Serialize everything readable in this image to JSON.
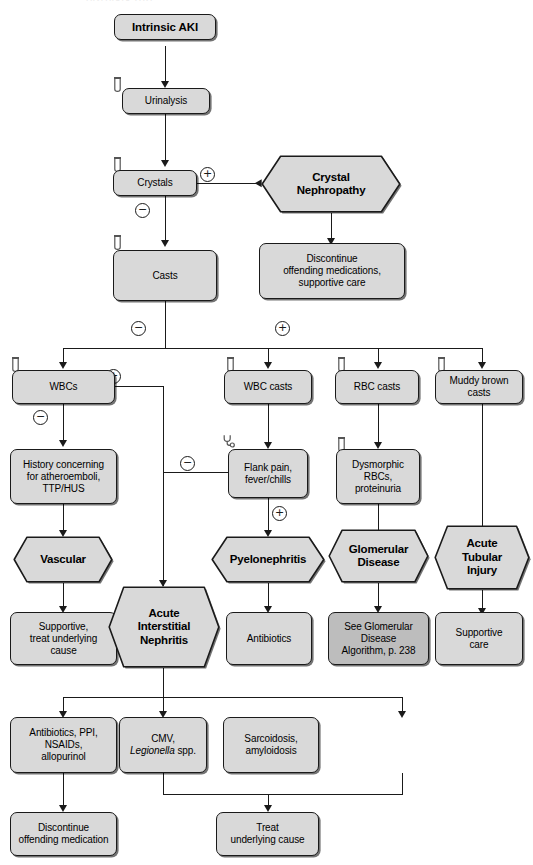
{
  "diagram": {
    "colors": {
      "node_fill": "#d9d9d9",
      "node_fill_dark": "#bdbdbd",
      "stroke": "#1a1a1a",
      "background": "#ffffff"
    },
    "nodes": {
      "intrinsic_aki": "Intrinsic AKI",
      "urinalysis": "Urinalysis",
      "crystals": "Crystals",
      "crystal_nephropathy": "Crystal\nNephropathy",
      "discontinue_meds": "Discontinue\noffending medications,\nsupportive care",
      "casts": "Casts",
      "wbcs": "WBCs",
      "wbc_casts": "WBC casts",
      "rbc_casts": "RBC casts",
      "muddy_brown_casts": "Muddy brown\ncasts",
      "history_atheroemboli": "History concerning\nfor atheroemboli,\nTTP/HUS",
      "flank_pain": "Flank pain,\nfever/chills",
      "dysmorphic_rbcs": "Dysmorphic\nRBCs,\nproteinuria",
      "vascular": "Vascular",
      "pyelonephritis": "Pyelonephritis",
      "glomerular_disease": "Glomerular\nDisease",
      "acute_tubular_injury": "Acute\nTubular\nInjury",
      "supportive_treat_cause": "Supportive,\ntreat underlying\ncause",
      "acute_interstitial_nephritis": "Acute\nInterstitial\nNephritis",
      "antibiotics": "Antibiotics",
      "see_glomerular_algorithm": "See Glomerular\nDisease\nAlgorithm, p. 238",
      "supportive_care": "Supportive\ncare",
      "ain_drugs": "Antibiotics, PPI,\nNSAIDs,\nallopurinol",
      "ain_infection_pre": "CMV,\n",
      "ain_infection_italic": "Legionella",
      "ain_infection_post": " spp.",
      "ain_systemic": "Sarcoidosis,\namyloidosis",
      "discontinue_offending": "Discontinue\noffending medication",
      "treat_underlying_cause": "Treat\nunderlying cause"
    },
    "signs": {
      "crystals_positive": "+",
      "crystals_negative": "−",
      "casts_negative": "−",
      "casts_positive": "+",
      "wbcs_positive": "+",
      "wbcs_negative": "−",
      "flank_negative": "−",
      "flank_positive": "+"
    },
    "icons": {
      "urine_tube": "test-tube-icon",
      "stethoscope": "stethoscope-icon"
    },
    "top_artifact": "Intrinsic AKI"
  }
}
